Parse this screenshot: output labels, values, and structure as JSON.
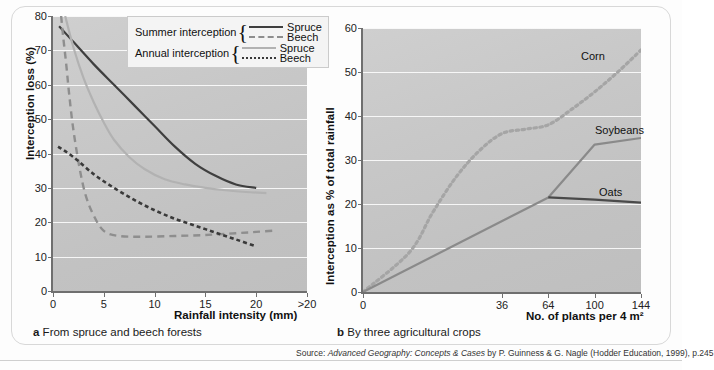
{
  "figure": {
    "source_prefix": "Source: ",
    "source_title": "Advanced Geography: Concepts & Cases",
    "source_rest": " by P. Guinness & G. Nagle (Hodder Education, 1999), p.245"
  },
  "panel_a": {
    "caption_marker": "a",
    "caption_text": "From spruce and beech forests",
    "legend": {
      "rows": [
        {
          "group": "Summer interception",
          "entries": [
            {
              "name": "Spruce",
              "style": "solid-dark"
            },
            {
              "name": "Beech",
              "style": "dash-grey"
            }
          ]
        },
        {
          "group": "Annual interception",
          "entries": [
            {
              "name": "Spruce",
              "style": "solid-light"
            },
            {
              "name": "Beech",
              "style": "dot-dark"
            }
          ]
        }
      ]
    }
  },
  "panel_b": {
    "caption_marker": "b",
    "caption_text": "By three agricultural crops",
    "series_labels": [
      "Corn",
      "Soybeans",
      "Oats"
    ]
  },
  "chart_data": [
    {
      "id": "panel_a",
      "type": "line",
      "title": "",
      "xlabel": "Rainfall intensity (mm)",
      "ylabel": "Interception loss (%)",
      "xlim": [
        0,
        25
      ],
      "ylim": [
        0,
        80
      ],
      "xticks": [
        0,
        5,
        10,
        15,
        20,
        25
      ],
      "xticklabels": [
        "0",
        "5",
        "10",
        "15",
        "20",
        ">20"
      ],
      "yticks": [
        0,
        10,
        20,
        30,
        40,
        50,
        60,
        70,
        80
      ],
      "yticklabels": [
        "0",
        "10",
        "20",
        "30",
        "40",
        "50",
        "60",
        "70",
        "80"
      ],
      "grid": "horizontal",
      "legend_position": "upper-right-inside",
      "series": [
        {
          "name": "Summer interception - Spruce",
          "style": "solid-dark",
          "color": "#3f3f3f",
          "x": [
            0.6,
            2,
            4,
            6,
            8,
            10,
            12,
            14,
            16,
            18,
            20
          ],
          "y": [
            77,
            72.5,
            66,
            60,
            54,
            48,
            42,
            37,
            33.5,
            31,
            30
          ]
        },
        {
          "name": "Summer interception - Beech",
          "style": "dash-grey",
          "color": "#8e8e8e",
          "x": [
            0.8,
            1.0,
            1.3,
            1.6,
            2.0,
            2.6,
            3.2,
            4.0,
            5.0,
            6.5,
            9,
            12,
            15,
            18,
            20,
            22
          ],
          "y": [
            80,
            74,
            66,
            57,
            47,
            36,
            28,
            22,
            17.5,
            16,
            15.8,
            16,
            16.3,
            16.8,
            17.2,
            17.6
          ]
        },
        {
          "name": "Annual interception - Spruce",
          "style": "solid-light",
          "color": "#b2b2b2",
          "x": [
            1.2,
            2,
            3,
            4,
            5,
            6,
            7.5,
            9,
            11,
            13,
            15,
            17,
            19,
            21
          ],
          "y": [
            80,
            71,
            62,
            55,
            49,
            44,
            39,
            35.5,
            32.5,
            31,
            30,
            29.3,
            28.8,
            28.5
          ]
        },
        {
          "name": "Annual interception - Beech",
          "style": "dot-dark",
          "color": "#3a3a3a",
          "x": [
            0.5,
            2,
            4,
            6,
            8,
            10,
            12,
            14,
            16,
            18,
            20
          ],
          "y": [
            42,
            39,
            34,
            30,
            26.5,
            23.5,
            21,
            19,
            17,
            15,
            13
          ]
        }
      ]
    },
    {
      "id": "panel_b",
      "type": "line",
      "title": "",
      "xlabel": "No. of plants per 4 m²",
      "ylabel": "Interception as % of total rainfall",
      "xlim": [
        0,
        144
      ],
      "ylim": [
        0,
        60
      ],
      "xticks": [
        0,
        36,
        64,
        100,
        144
      ],
      "xticklabels": [
        "0",
        "36",
        "64",
        "100",
        "144"
      ],
      "xscale": "sqrt",
      "yticks": [
        0,
        10,
        20,
        30,
        40,
        50,
        60
      ],
      "yticklabels": [
        "0",
        "10",
        "20",
        "30",
        "40",
        "50",
        "60"
      ],
      "grid": "horizontal",
      "legend_position": "inline-labels",
      "series": [
        {
          "name": "Corn",
          "style": "dotted-grey",
          "color": "#a5a5a5",
          "x": [
            0,
            4,
            9,
            16,
            25,
            36,
            49,
            64,
            81,
            100,
            121,
            144
          ],
          "y": [
            0,
            9,
            18,
            26,
            32,
            36,
            37,
            38,
            41.5,
            45.5,
            50,
            55
          ]
        },
        {
          "name": "Soybeans",
          "style": "solid-grey",
          "color": "#8a8a8a",
          "x": [
            0,
            64,
            100,
            144
          ],
          "y": [
            0,
            21.5,
            33.5,
            35
          ]
        },
        {
          "name": "Oats",
          "style": "solid-dark",
          "color": "#4a4a4a",
          "x": [
            64,
            100,
            144
          ],
          "y": [
            21.5,
            21,
            20.3
          ]
        }
      ]
    }
  ]
}
